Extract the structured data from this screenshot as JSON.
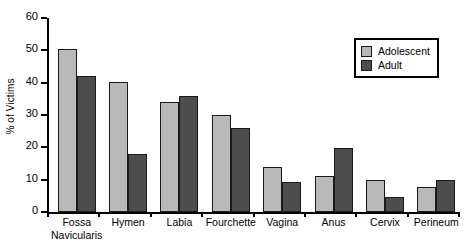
{
  "chart_data": {
    "type": "bar",
    "title": "",
    "xlabel": "",
    "ylabel": "% of Victims",
    "ylim": [
      0,
      60
    ],
    "yticks": [
      0,
      10,
      20,
      30,
      40,
      50,
      60
    ],
    "ytick_labels": [
      "0",
      "10",
      "20",
      "30",
      "40",
      "50",
      "60"
    ],
    "grid": false,
    "legend_position": "top-right",
    "categories": [
      "Fossa Navicularis",
      "Hymen",
      "Labia",
      "Fourchette",
      "Vagina",
      "Anus",
      "Cervix",
      "Perineum"
    ],
    "category_lines": [
      [
        "Fossa",
        "Navicularis"
      ],
      [
        "Hymen"
      ],
      [
        "Labia"
      ],
      [
        "Fourchette"
      ],
      [
        "Vagina"
      ],
      [
        "Anus"
      ],
      [
        "Cervix"
      ],
      [
        "Perineum"
      ]
    ],
    "series": [
      {
        "name": "Adolescent",
        "color": "#b9b9b9",
        "values": [
          50.3,
          40.2,
          34.0,
          30.0,
          14.0,
          11.0,
          10.0,
          7.6
        ]
      },
      {
        "name": "Adult",
        "color": "#4d4d4d",
        "values": [
          42.0,
          18.0,
          36.0,
          26.0,
          9.2,
          19.8,
          4.7,
          9.8
        ]
      }
    ]
  },
  "legend": {
    "items": [
      {
        "label": "Adolescent",
        "swatch": "adolescent"
      },
      {
        "label": "Adult",
        "swatch": "adult"
      }
    ]
  },
  "colors": {
    "adolescent": "#b9b9b9",
    "adult": "#4d4d4d",
    "axis": "#000000",
    "background": "#ffffff"
  }
}
